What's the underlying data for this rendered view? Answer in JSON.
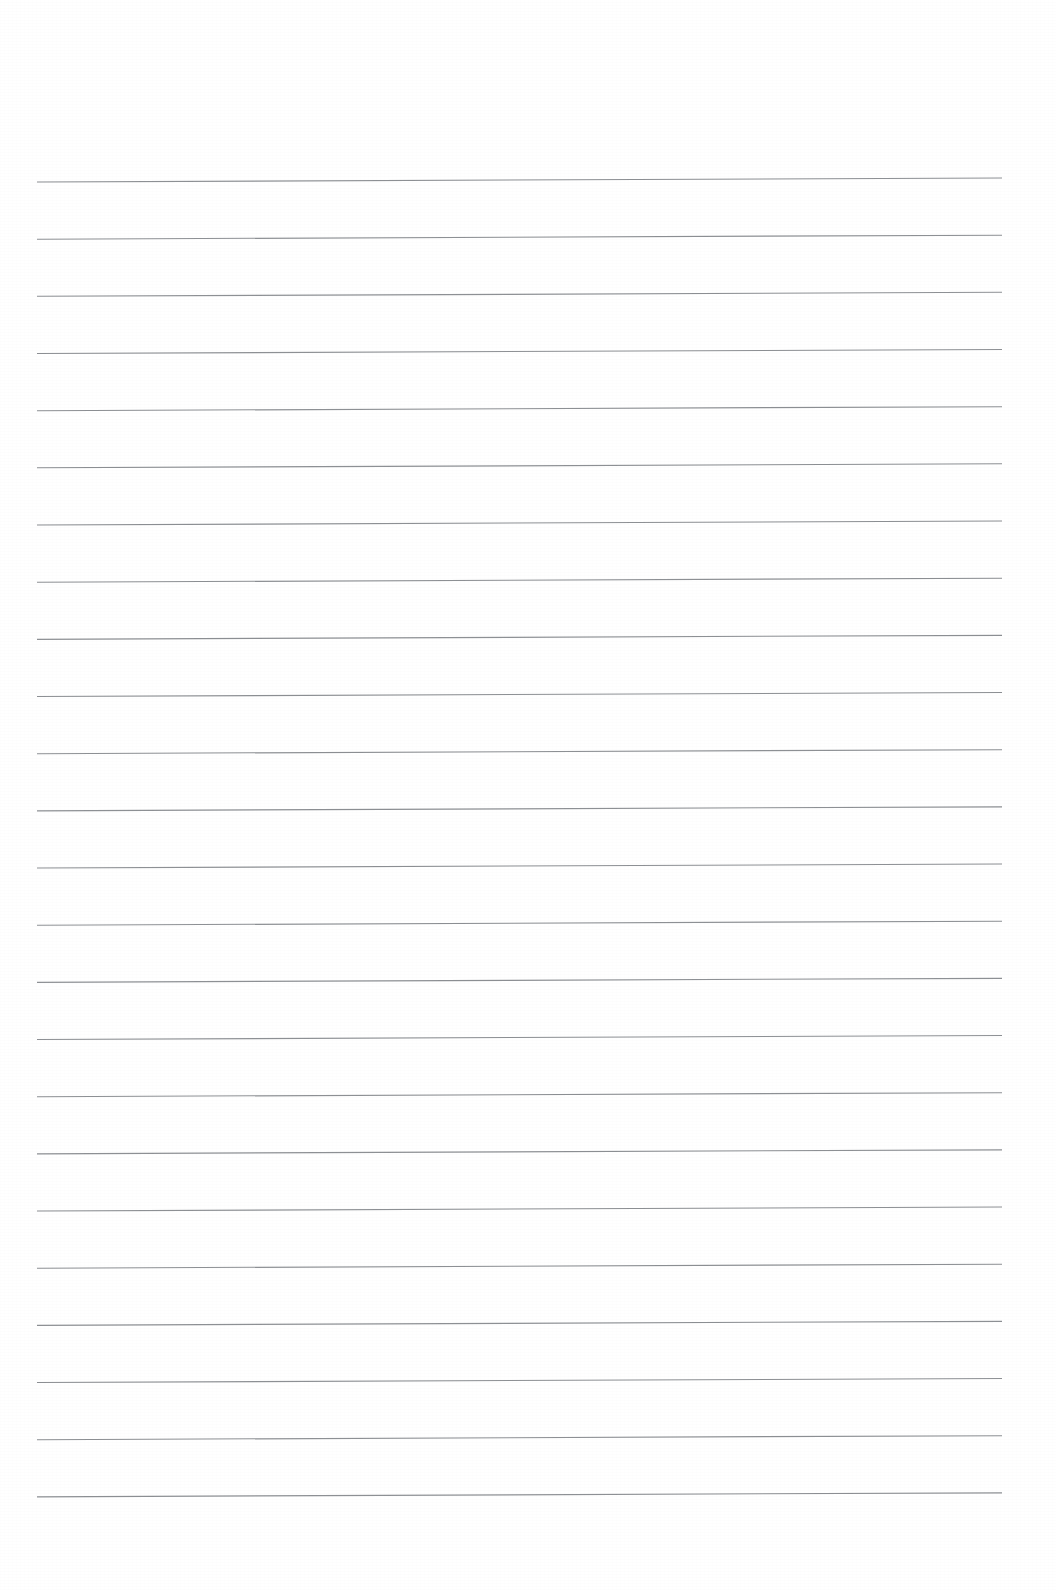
{
  "document": {
    "kind": "scanned-ruled-notepaper",
    "title": "Blank Ruled Notepad Page",
    "orientation": "portrait",
    "page_width_px": 1056,
    "page_height_px": 1590,
    "background_color": "#fefefe",
    "has_visible_text": false,
    "has_margin_rule": false,
    "has_header": false,
    "has_footer": false,
    "has_page_number": false,
    "has_handwriting": false
  },
  "ruling": {
    "line_color": "#8d9094",
    "line_width_px": 1.15,
    "line_count": 24,
    "line_spacing_px": 57.2,
    "left_x_px": 37,
    "right_x_px": 1002,
    "first_line_left_y_px": 182,
    "last_line_left_y_px": 1497,
    "skew_dy_px": -4,
    "skew_note": "lines rise slightly toward the right (scanner skew)",
    "lines": [
      {
        "index": 1,
        "left_y": 182.0,
        "right_y": 178.0,
        "text": ""
      },
      {
        "index": 2,
        "left_y": 239.2,
        "right_y": 235.2,
        "text": ""
      },
      {
        "index": 3,
        "left_y": 296.3,
        "right_y": 292.3,
        "text": ""
      },
      {
        "index": 4,
        "left_y": 353.5,
        "right_y": 349.5,
        "text": ""
      },
      {
        "index": 5,
        "left_y": 410.7,
        "right_y": 406.7,
        "text": ""
      },
      {
        "index": 6,
        "left_y": 467.8,
        "right_y": 463.8,
        "text": ""
      },
      {
        "index": 7,
        "left_y": 525.0,
        "right_y": 521.0,
        "text": ""
      },
      {
        "index": 8,
        "left_y": 582.2,
        "right_y": 578.2,
        "text": ""
      },
      {
        "index": 9,
        "left_y": 639.3,
        "right_y": 635.3,
        "text": ""
      },
      {
        "index": 10,
        "left_y": 696.5,
        "right_y": 692.5,
        "text": ""
      },
      {
        "index": 11,
        "left_y": 753.7,
        "right_y": 749.7,
        "text": ""
      },
      {
        "index": 12,
        "left_y": 810.8,
        "right_y": 806.8,
        "text": ""
      },
      {
        "index": 13,
        "left_y": 868.0,
        "right_y": 864.0,
        "text": ""
      },
      {
        "index": 14,
        "left_y": 925.2,
        "right_y": 921.2,
        "text": ""
      },
      {
        "index": 15,
        "left_y": 982.3,
        "right_y": 978.3,
        "text": ""
      },
      {
        "index": 16,
        "left_y": 1039.5,
        "right_y": 1035.5,
        "text": ""
      },
      {
        "index": 17,
        "left_y": 1096.7,
        "right_y": 1092.7,
        "text": ""
      },
      {
        "index": 18,
        "left_y": 1153.8,
        "right_y": 1149.8,
        "text": ""
      },
      {
        "index": 19,
        "left_y": 1211.0,
        "right_y": 1207.0,
        "text": ""
      },
      {
        "index": 20,
        "left_y": 1268.2,
        "right_y": 1264.2,
        "text": ""
      },
      {
        "index": 21,
        "left_y": 1325.3,
        "right_y": 1321.3,
        "text": ""
      },
      {
        "index": 22,
        "left_y": 1382.5,
        "right_y": 1378.5,
        "text": ""
      },
      {
        "index": 23,
        "left_y": 1439.7,
        "right_y": 1435.7,
        "text": ""
      },
      {
        "index": 24,
        "left_y": 1496.8,
        "right_y": 1492.8,
        "text": ""
      }
    ]
  },
  "margins": {
    "top_blank_px": 182,
    "bottom_blank_px": 93,
    "left_blank_px": 37,
    "right_blank_px": 54
  }
}
